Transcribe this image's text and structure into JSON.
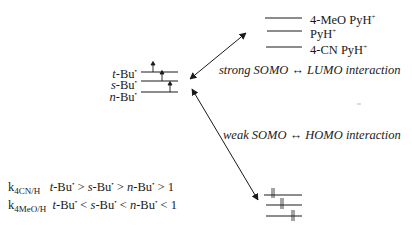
{
  "radicals": {
    "levels": [
      {
        "prefix": "t",
        "name": "-Bu",
        "mark": "•"
      },
      {
        "prefix": "s",
        "name": "-Bu",
        "mark": "•"
      },
      {
        "prefix": "n",
        "name": "-Bu",
        "mark": "•"
      }
    ],
    "electron_symbol": "↑"
  },
  "lumo": {
    "levels": [
      {
        "label": "4-MeO PyH",
        "charge": "+"
      },
      {
        "label": "PyH",
        "charge": "+"
      },
      {
        "label": "4-CN PyH",
        "charge": "+"
      }
    ]
  },
  "homo": {
    "electron_symbol": "⇅",
    "count": 3
  },
  "interactions": {
    "strong": "strong SOMO ↔ LUMO interaction",
    "weak": "weak SOMO ↔ HOMO interaction"
  },
  "rate_relations": [
    {
      "k": "k",
      "sub": "4CN/H",
      "terms": [
        "t",
        "-Bu",
        "•",
        " > ",
        "s",
        "-Bu",
        "•",
        " > ",
        "n",
        "-Bu",
        "•",
        " > 1"
      ]
    },
    {
      "k": "k",
      "sub": "4MeO/H",
      "terms": [
        "t",
        "-Bu",
        "•",
        " < ",
        "s",
        "-Bu",
        "•",
        " < ",
        "n",
        "-Bu",
        "•",
        " < 1"
      ]
    }
  ]
}
